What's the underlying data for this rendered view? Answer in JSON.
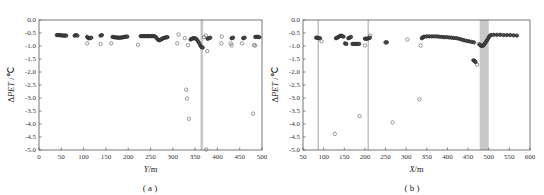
{
  "chart_data": [
    {
      "id": "a",
      "type": "scatter",
      "caption": "( a )",
      "xlabel": "Y/m",
      "ylabel": "ΔPET /℃",
      "xlim": [
        0,
        500
      ],
      "ylim": [
        -5.0,
        0.0
      ],
      "xticks": [
        0,
        50,
        100,
        150,
        200,
        250,
        300,
        350,
        400,
        450,
        500
      ],
      "yticks": [
        0.0,
        -0.5,
        -1.0,
        -1.5,
        -2.0,
        -2.5,
        -3.0,
        -3.5,
        -4.0,
        -4.5,
        -5.0
      ],
      "grid": false,
      "highlight_bands": [
        {
          "x0": 362,
          "x1": 368,
          "color": "#c8c8c8"
        }
      ],
      "highlight_lines": [],
      "series": [
        {
          "name": "dense points",
          "marker": "filled-circle",
          "points": [
            [
              40,
              -0.58
            ],
            [
              43,
              -0.58
            ],
            [
              46,
              -0.58
            ],
            [
              49,
              -0.59
            ],
            [
              52,
              -0.59
            ],
            [
              55,
              -0.6
            ],
            [
              58,
              -0.6
            ],
            [
              61,
              -0.6
            ],
            [
              80,
              -0.6
            ],
            [
              83,
              -0.58
            ],
            [
              86,
              -0.6
            ],
            [
              108,
              -0.65
            ],
            [
              111,
              -0.7
            ],
            [
              114,
              -0.7
            ],
            [
              117,
              -0.68
            ],
            [
              138,
              -0.6
            ],
            [
              141,
              -0.58
            ],
            [
              165,
              -0.65
            ],
            [
              168,
              -0.66
            ],
            [
              171,
              -0.67
            ],
            [
              174,
              -0.67
            ],
            [
              177,
              -0.68
            ],
            [
              180,
              -0.68
            ],
            [
              183,
              -0.68
            ],
            [
              186,
              -0.67
            ],
            [
              189,
              -0.66
            ],
            [
              192,
              -0.65
            ],
            [
              195,
              -0.64
            ],
            [
              198,
              -0.64
            ],
            [
              228,
              -0.62
            ],
            [
              231,
              -0.62
            ],
            [
              234,
              -0.62
            ],
            [
              237,
              -0.62
            ],
            [
              240,
              -0.62
            ],
            [
              243,
              -0.62
            ],
            [
              246,
              -0.62
            ],
            [
              249,
              -0.62
            ],
            [
              252,
              -0.62
            ],
            [
              255,
              -0.62
            ],
            [
              258,
              -0.62
            ],
            [
              261,
              -0.64
            ],
            [
              264,
              -0.7
            ],
            [
              267,
              -0.76
            ],
            [
              270,
              -0.78
            ],
            [
              273,
              -0.76
            ],
            [
              276,
              -0.72
            ],
            [
              279,
              -0.7
            ],
            [
              282,
              -0.68
            ],
            [
              285,
              -0.67
            ],
            [
              288,
              -0.66
            ],
            [
              340,
              -0.75
            ],
            [
              343,
              -0.72
            ],
            [
              346,
              -0.7
            ],
            [
              349,
              -0.7
            ],
            [
              352,
              -0.72
            ],
            [
              355,
              -0.78
            ],
            [
              358,
              -0.86
            ],
            [
              361,
              -0.96
            ],
            [
              364,
              -1.04
            ],
            [
              367,
              -1.06
            ],
            [
              378,
              -0.72
            ],
            [
              381,
              -0.7
            ],
            [
              384,
              -0.68
            ],
            [
              432,
              -0.7
            ],
            [
              435,
              -0.68
            ],
            [
              458,
              -0.7
            ],
            [
              461,
              -0.68
            ],
            [
              485,
              -0.65
            ],
            [
              488,
              -0.65
            ],
            [
              491,
              -0.65
            ],
            [
              494,
              -0.66
            ]
          ]
        },
        {
          "name": "sparse points",
          "marker": "open-circle",
          "points": [
            [
              108,
              -0.9
            ],
            [
              138,
              -0.92
            ],
            [
              162,
              -0.9
            ],
            [
              222,
              -0.95
            ],
            [
              310,
              -0.9
            ],
            [
              313,
              -0.56
            ],
            [
              327,
              -0.7
            ],
            [
              330,
              -2.68
            ],
            [
              332,
              -3.02
            ],
            [
              334,
              -0.97
            ],
            [
              336,
              -3.8
            ],
            [
              370,
              -0.66
            ],
            [
              374,
              -0.6
            ],
            [
              375,
              -4.98
            ],
            [
              377,
              -1.2
            ],
            [
              380,
              -0.7
            ],
            [
              409,
              -0.9
            ],
            [
              410,
              -0.64
            ],
            [
              430,
              -0.9
            ],
            [
              432,
              -0.98
            ],
            [
              455,
              -0.9
            ],
            [
              480,
              -3.6
            ],
            [
              482,
              -0.97
            ],
            [
              485,
              -0.98
            ]
          ]
        }
      ]
    },
    {
      "id": "b",
      "type": "scatter",
      "caption": "( b )",
      "xlabel": "X/m",
      "ylabel": "ΔPET /℃",
      "xlim": [
        50,
        600
      ],
      "ylim": [
        -5.0,
        0.0
      ],
      "xticks": [
        50,
        100,
        150,
        200,
        250,
        300,
        350,
        400,
        450,
        500,
        550,
        600
      ],
      "yticks": [
        0.0,
        -0.5,
        -1.0,
        -1.5,
        -2.0,
        -2.5,
        -3.0,
        -3.5,
        -4.0,
        -4.5,
        -5.0
      ],
      "grid": false,
      "highlight_bands": [
        {
          "x0": 478,
          "x1": 500,
          "color": "#c8c8c8"
        }
      ],
      "highlight_lines": [
        {
          "x": 87,
          "color": "#bdbdbd"
        },
        {
          "x": 208,
          "color": "#bdbdbd"
        }
      ],
      "series": [
        {
          "name": "dense points",
          "marker": "filled-circle",
          "points": [
            [
              82,
              -0.68
            ],
            [
              85,
              -0.68
            ],
            [
              88,
              -0.7
            ],
            [
              91,
              -0.7
            ],
            [
              130,
              -0.7
            ],
            [
              133,
              -0.68
            ],
            [
              136,
              -0.65
            ],
            [
              139,
              -0.62
            ],
            [
              142,
              -0.6
            ],
            [
              145,
              -0.62
            ],
            [
              148,
              -0.64
            ],
            [
              152,
              -0.9
            ],
            [
              155,
              -0.92
            ],
            [
              160,
              -0.7
            ],
            [
              163,
              -0.68
            ],
            [
              166,
              -0.65
            ],
            [
              170,
              -0.92
            ],
            [
              174,
              -0.92
            ],
            [
              178,
              -0.92
            ],
            [
              182,
              -0.92
            ],
            [
              186,
              -0.92
            ],
            [
              200,
              -0.72
            ],
            [
              203,
              -0.72
            ],
            [
              206,
              -0.72
            ],
            [
              209,
              -0.7
            ],
            [
              212,
              -0.68
            ],
            [
              250,
              -0.86
            ],
            [
              253,
              -0.86
            ],
            [
              338,
              -0.7
            ],
            [
              341,
              -0.66
            ],
            [
              344,
              -0.64
            ],
            [
              350,
              -0.63
            ],
            [
              356,
              -0.63
            ],
            [
              362,
              -0.63
            ],
            [
              368,
              -0.63
            ],
            [
              374,
              -0.63
            ],
            [
              380,
              -0.64
            ],
            [
              386,
              -0.65
            ],
            [
              392,
              -0.66
            ],
            [
              398,
              -0.66
            ],
            [
              404,
              -0.67
            ],
            [
              410,
              -0.68
            ],
            [
              416,
              -0.69
            ],
            [
              422,
              -0.7
            ],
            [
              428,
              -0.72
            ],
            [
              434,
              -0.75
            ],
            [
              440,
              -0.78
            ],
            [
              446,
              -0.8
            ],
            [
              452,
              -0.82
            ],
            [
              458,
              -0.84
            ],
            [
              464,
              -0.86
            ],
            [
              463,
              -1.55
            ],
            [
              466,
              -1.58
            ],
            [
              468,
              -1.62
            ],
            [
              478,
              -0.95
            ],
            [
              481,
              -0.98
            ],
            [
              484,
              -1.0
            ],
            [
              487,
              -0.98
            ],
            [
              490,
              -0.92
            ],
            [
              493,
              -0.85
            ],
            [
              496,
              -0.78
            ],
            [
              499,
              -0.7
            ],
            [
              502,
              -0.62
            ],
            [
              505,
              -0.58
            ],
            [
              512,
              -0.57
            ],
            [
              520,
              -0.57
            ],
            [
              528,
              -0.57
            ],
            [
              536,
              -0.58
            ],
            [
              544,
              -0.58
            ],
            [
              552,
              -0.58
            ],
            [
              560,
              -0.59
            ],
            [
              568,
              -0.6
            ]
          ]
        },
        {
          "name": "sparse points",
          "marker": "open-circle",
          "points": [
            [
              95,
              -0.82
            ],
            [
              127,
              -4.38
            ],
            [
              187,
              -3.7
            ],
            [
              200,
              -0.98
            ],
            [
              213,
              -0.6
            ],
            [
              252,
              -0.86
            ],
            [
              267,
              -3.94
            ],
            [
              303,
              -0.75
            ],
            [
              332,
              -3.05
            ],
            [
              335,
              -0.98
            ],
            [
              472,
              -1.72
            ],
            [
              476,
              -0.92
            ]
          ]
        }
      ]
    }
  ]
}
